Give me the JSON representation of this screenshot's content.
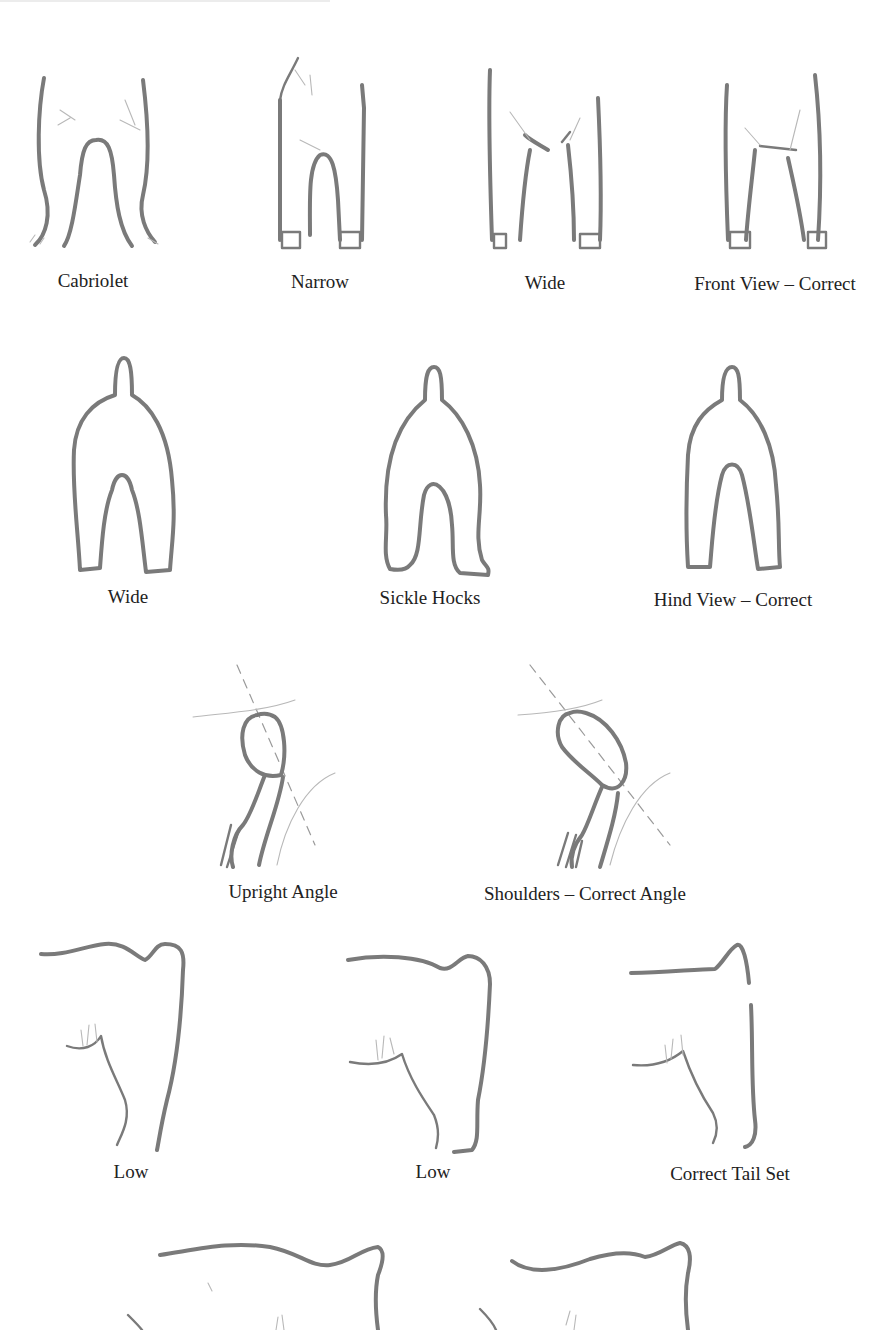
{
  "figures": {
    "front_view": [
      {
        "caption": "Cabriolet"
      },
      {
        "caption": "Narrow"
      },
      {
        "caption": "Wide"
      },
      {
        "caption": "Front View – Correct"
      }
    ],
    "hind_view": [
      {
        "caption": "Wide"
      },
      {
        "caption": "Sickle Hocks"
      },
      {
        "caption": "Hind View – Correct"
      }
    ],
    "shoulders": [
      {
        "caption": "Upright Angle"
      },
      {
        "caption": "Shoulders – Correct Angle"
      }
    ],
    "tail_set": [
      {
        "caption": "Low"
      },
      {
        "caption": "Low"
      },
      {
        "caption": "Correct Tail Set"
      }
    ]
  },
  "colors": {
    "line": "#7a7a7a",
    "text": "#222222",
    "background": "#ffffff"
  }
}
